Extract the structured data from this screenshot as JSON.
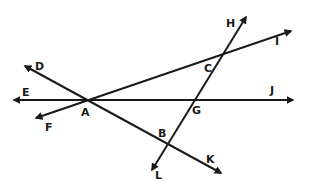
{
  "diagram": {
    "type": "geometry-lines",
    "points": {
      "A": {
        "label": "A",
        "x": 87,
        "y": 100
      },
      "B": {
        "label": "B",
        "x": 167,
        "y": 145
      },
      "C": {
        "label": "C",
        "x": 222,
        "y": 54
      },
      "G": {
        "label": "G",
        "x": 196,
        "y": 100
      }
    },
    "endpoints": {
      "D": {
        "label": "D",
        "x": 25,
        "y": 66
      },
      "E": {
        "label": "E",
        "x": 14,
        "y": 100
      },
      "F": {
        "label": "F",
        "x": 36,
        "y": 118
      },
      "H": {
        "label": "H",
        "x": 246,
        "y": 17
      },
      "I": {
        "label": "I",
        "x": 291,
        "y": 31
      },
      "J": {
        "label": "J",
        "x": 293,
        "y": 100
      },
      "K": {
        "label": "K",
        "x": 221,
        "y": 173
      },
      "L": {
        "label": "L",
        "x": 152,
        "y": 170
      }
    },
    "lines": [
      {
        "name": "EJ",
        "from": "E",
        "to": "J",
        "through": [
          "A",
          "G"
        ]
      },
      {
        "name": "DK",
        "from": "D",
        "to": "K",
        "through": [
          "A",
          "B"
        ]
      },
      {
        "name": "FI",
        "from": "F",
        "to": "I",
        "through": [
          "A",
          "C"
        ]
      },
      {
        "name": "HL",
        "from": "H",
        "to": "L",
        "through": [
          "C",
          "G",
          "B"
        ]
      }
    ],
    "labels": {
      "D": "D",
      "E": "E",
      "F": "F",
      "A": "A",
      "H": "H",
      "C": "C",
      "I": "I",
      "G": "G",
      "J": "J",
      "B": "B",
      "L": "L",
      "K": "K"
    },
    "colors": {
      "stroke": "#1a1a1a",
      "background": "#ffffff"
    }
  }
}
